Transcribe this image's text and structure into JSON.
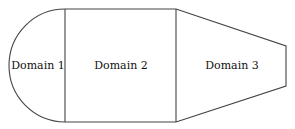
{
  "diagram": {
    "regions": [
      {
        "id": "domain-1",
        "label": "Domain 1",
        "shape": "half-disk"
      },
      {
        "id": "domain-2",
        "label": "Domain 2",
        "shape": "rectangle"
      },
      {
        "id": "domain-3",
        "label": "Domain 3",
        "shape": "trapezoid"
      }
    ],
    "colors": {
      "stroke": "#444444",
      "background": "#ffffff",
      "text": "#111111"
    }
  }
}
